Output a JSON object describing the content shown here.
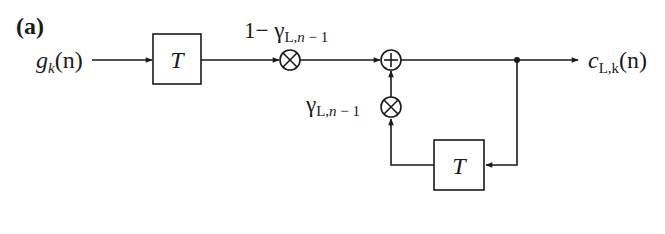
{
  "diagram": {
    "panel_label": "(a)",
    "input": {
      "main": "g",
      "sub": "k",
      "arg": "(n)"
    },
    "output": {
      "main": "c",
      "sub": "L,k",
      "arg": "(n)"
    },
    "delay_blocks": [
      {
        "id": "delay-forward",
        "label": "T"
      },
      {
        "id": "delay-feedback",
        "label": "T"
      }
    ],
    "multipliers": [
      {
        "id": "mult-forward",
        "coef_prefix": "1− ",
        "coef_main": "γ",
        "coef_sub": "L,",
        "coef_sub_it": "n",
        "coef_sub_tail": " − 1"
      },
      {
        "id": "mult-feedback",
        "coef_prefix": "",
        "coef_main": "γ",
        "coef_sub": "L,",
        "coef_sub_it": "n",
        "coef_sub_tail": " − 1"
      }
    ],
    "adder": {
      "id": "adder",
      "symbol": "+"
    },
    "colors": {
      "stroke": "#1a1a1a",
      "background": "#ffffff"
    }
  }
}
